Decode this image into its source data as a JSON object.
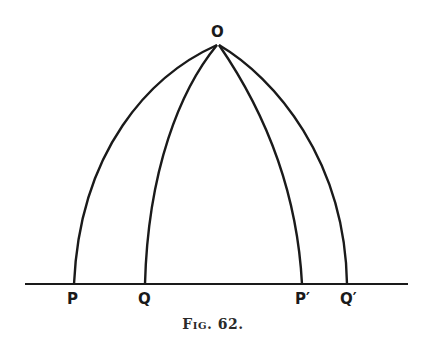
{
  "figure": {
    "caption": "Fig. 62.",
    "stroke_color": "#1a1a1a",
    "background": "#ffffff",
    "apex": {
      "label": "O",
      "x": 218,
      "y": 44
    },
    "baseline": {
      "y": 284,
      "x_start": 25,
      "x_end": 408
    },
    "points": [
      {
        "label": "P",
        "x": 74
      },
      {
        "label": "Q",
        "x": 145
      },
      {
        "label": "P′",
        "x": 302
      },
      {
        "label": "Q′",
        "x": 347
      }
    ],
    "arcs": [
      {
        "from": "O",
        "to": "P"
      },
      {
        "from": "O",
        "to": "Q"
      },
      {
        "from": "O",
        "to": "P′"
      },
      {
        "from": "O",
        "to": "Q′"
      }
    ]
  }
}
